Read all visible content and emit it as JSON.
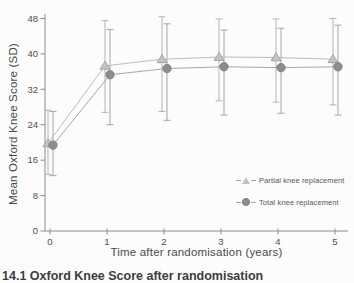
{
  "figure": {
    "caption_fragment": "14.1 Oxford Knee Score after randomisation"
  },
  "chart_data": {
    "type": "line",
    "title": "",
    "xlabel": "Time after randomisation (years)",
    "ylabel": "Mean Oxford Knee Score (SD)",
    "x": [
      0,
      1,
      2,
      3,
      4,
      5
    ],
    "x_ticks": [
      0,
      1,
      2,
      3,
      4,
      5
    ],
    "y_ticks": [
      0,
      8,
      16,
      24,
      32,
      40,
      48
    ],
    "ylim": [
      0,
      48
    ],
    "grid": false,
    "error_bars": true,
    "legend_position": "lower right",
    "series": [
      {
        "name": "Partial knee replacement",
        "marker": "triangle",
        "color_key": "partial",
        "means": [
          19.8,
          37.3,
          38.8,
          39.3,
          39.2,
          38.8
        ],
        "err_low": [
          12.8,
          26.8,
          27.0,
          29.4,
          29.1,
          28.5
        ],
        "err_high": [
          27.3,
          47.5,
          48.4,
          47.9,
          47.9,
          48.0
        ]
      },
      {
        "name": "Total knee replacement",
        "marker": "circle",
        "color_key": "total",
        "means": [
          19.4,
          35.3,
          36.7,
          37.1,
          36.9,
          37.1
        ],
        "err_low": [
          12.5,
          24.0,
          25.0,
          26.2,
          26.6,
          26.2
        ],
        "err_high": [
          27.0,
          45.5,
          46.8,
          45.4,
          45.8,
          46.5
        ]
      }
    ]
  },
  "colors": {
    "background": "#fcfcfc",
    "axis": "#8c8c8c",
    "text": "#4f4f4f",
    "partial_line": "#bdbdbd",
    "partial_marker_fill": "#c4c4c4",
    "partial_marker_stroke": "#999999",
    "partial_error": "#adadad",
    "total_line": "#a7a7a7",
    "total_marker_fill": "#8d8d8d",
    "total_marker_stroke": "#787878",
    "total_error": "#9d9d9d",
    "caption": "#3d3d3d"
  }
}
